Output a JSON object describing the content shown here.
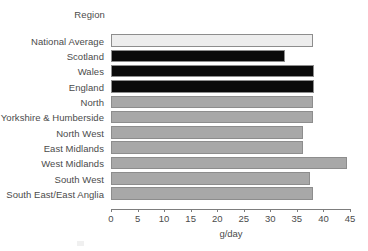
{
  "chart_data": {
    "type": "bar",
    "orientation": "horizontal",
    "title": "",
    "legend_title": "Region",
    "xlabel": "g/day",
    "ylabel": "",
    "xlim": [
      0,
      45
    ],
    "xticks": [
      0,
      5,
      10,
      15,
      20,
      25,
      30,
      35,
      40,
      45
    ],
    "grid": false,
    "legend_position": "none",
    "categories": [
      "National Average",
      "Scotland",
      "Wales",
      "England",
      "North",
      "Yorkshire & Humberside",
      "North West",
      "East Midlands",
      "West Midlands",
      "South West",
      "South East/East Anglia"
    ],
    "values": [
      38.0,
      32.8,
      38.2,
      38.2,
      38.0,
      38.0,
      36.2,
      36.2,
      44.5,
      37.5,
      38.0
    ],
    "bar_colors": [
      "#ededed",
      "#0a0a0a",
      "#0a0a0a",
      "#0a0a0a",
      "#a8a8a8",
      "#a8a8a8",
      "#a8a8a8",
      "#a8a8a8",
      "#a8a8a8",
      "#a8a8a8",
      "#a8a8a8"
    ],
    "bar_edge_color": "#8d8d8d",
    "axis_color": "#7d7d7d",
    "text_color": "#4b4b4b",
    "background": "#ffffff"
  },
  "axis": {
    "tick_labels": [
      "0",
      "5",
      "10",
      "15",
      "20",
      "25",
      "30",
      "35",
      "40",
      "45"
    ],
    "x_title": "g/day"
  },
  "legend": {
    "title": "Region"
  },
  "rows": [
    {
      "label": "National Average",
      "value": 38.0
    },
    {
      "label": "Scotland",
      "value": 32.8
    },
    {
      "label": "Wales",
      "value": 38.2
    },
    {
      "label": "England",
      "value": 38.2
    },
    {
      "label": "North",
      "value": 38.0
    },
    {
      "label": "Yorkshire & Humberside",
      "value": 38.0
    },
    {
      "label": "North West",
      "value": 36.2
    },
    {
      "label": "East Midlands",
      "value": 36.2
    },
    {
      "label": "West Midlands",
      "value": 44.5
    },
    {
      "label": "South West",
      "value": 37.5
    },
    {
      "label": "South East/East Anglia",
      "value": 38.0
    }
  ]
}
